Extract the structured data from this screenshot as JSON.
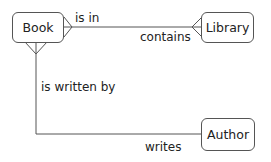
{
  "diagram": {
    "type": "entity-relationship",
    "entities": [
      {
        "id": "book",
        "label": "Book"
      },
      {
        "id": "library",
        "label": "Library"
      },
      {
        "id": "author",
        "label": "Author"
      }
    ],
    "relationships": [
      {
        "from": "book",
        "to": "library",
        "forward_label": "is in",
        "reverse_label": "contains",
        "from_cardinality": "many",
        "to_cardinality": "many"
      },
      {
        "from": "book",
        "to": "author",
        "forward_label": "is written by",
        "reverse_label": "writes",
        "from_cardinality": "many",
        "to_cardinality": "one"
      }
    ]
  },
  "colors": {
    "line": "#555555",
    "text": "#222222",
    "background": "#ffffff"
  }
}
